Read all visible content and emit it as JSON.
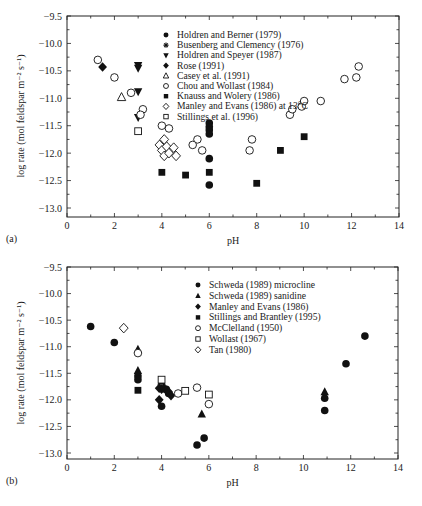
{
  "chart_data": [
    {
      "type": "scatter",
      "panel_label": "(a)",
      "xlabel": "pH",
      "ylabel": "log rate (mol feldspar m⁻² s⁻¹)",
      "xlim": [
        0,
        14
      ],
      "ylim": [
        -13.0,
        -9.5
      ],
      "xticks": [
        0,
        2,
        4,
        6,
        8,
        10,
        12,
        14
      ],
      "yticks": [
        -9.5,
        -10.0,
        -10.5,
        -11.0,
        -11.5,
        -12.0,
        -12.5,
        -13.0
      ],
      "xtick_labels": [
        "0",
        "2",
        "4",
        "6",
        "8",
        "10",
        "12",
        "14"
      ],
      "ytick_labels": [
        "-9.5",
        "-10.0",
        "-10.5",
        "-11.0",
        "-11.5",
        "-12.0",
        "-12.5",
        "-13.0"
      ],
      "grid": false,
      "legend_position": "upper center",
      "series": [
        {
          "name": "Holdren and Berner (1979)",
          "marker": "filled-circle",
          "points": [
            [
              6.0,
              -11.45
            ],
            [
              6.0,
              -11.52
            ],
            [
              6.0,
              -11.58
            ],
            [
              6.0,
              -11.65
            ],
            [
              6.0,
              -12.1
            ],
            [
              6.0,
              -12.58
            ]
          ]
        },
        {
          "name": "Busenberg and Clemency (1976)",
          "marker": "asterisk",
          "points": []
        },
        {
          "name": "Holdren and Speyer (1987)",
          "marker": "filled-triangle-down",
          "points": [
            [
              3.0,
              -10.4
            ],
            [
              3.0,
              -10.45
            ],
            [
              3.0,
              -10.88
            ],
            [
              3.0,
              -11.35
            ]
          ]
        },
        {
          "name": "Rose (1991)",
          "marker": "filled-diamond",
          "points": [
            [
              1.5,
              -10.43
            ]
          ]
        },
        {
          "name": "Casey et al. (1991)",
          "marker": "open-triangle-up",
          "points": [
            [
              2.3,
              -10.98
            ]
          ]
        },
        {
          "name": "Chou and Wollast (1984)",
          "marker": "open-circle",
          "points": [
            [
              1.3,
              -10.3
            ],
            [
              2.0,
              -10.62
            ],
            [
              2.7,
              -10.9
            ],
            [
              3.2,
              -11.2
            ],
            [
              3.1,
              -11.3
            ],
            [
              4.0,
              -11.5
            ],
            [
              4.3,
              -11.55
            ],
            [
              5.5,
              -11.75
            ],
            [
              5.3,
              -11.85
            ],
            [
              5.7,
              -11.95
            ],
            [
              7.8,
              -11.75
            ],
            [
              7.7,
              -11.95
            ],
            [
              9.4,
              -11.3
            ],
            [
              9.5,
              -11.2
            ],
            [
              9.9,
              -11.15
            ],
            [
              10.0,
              -11.05
            ],
            [
              10.7,
              -11.05
            ],
            [
              11.7,
              -10.65
            ],
            [
              12.2,
              -10.62
            ],
            [
              12.3,
              -10.42
            ]
          ]
        },
        {
          "name": "Knauss and Wolery (1986)",
          "marker": "filled-square",
          "points": [
            [
              4.0,
              -12.35
            ],
            [
              5.0,
              -12.4
            ],
            [
              6.0,
              -12.35
            ],
            [
              8.0,
              -12.55
            ],
            [
              9.0,
              -11.95
            ],
            [
              10.0,
              -11.7
            ]
          ]
        },
        {
          "name": "Manley and Evans (1986) at 13°C",
          "marker": "open-diamond",
          "points": [
            [
              3.9,
              -11.85
            ],
            [
              4.0,
              -11.95
            ],
            [
              4.1,
              -12.05
            ],
            [
              4.2,
              -11.88
            ],
            [
              4.3,
              -12.0
            ],
            [
              4.5,
              -11.9
            ],
            [
              4.6,
              -12.05
            ],
            [
              4.1,
              -11.75
            ]
          ]
        },
        {
          "name": "Stillings et al. (1996)",
          "marker": "open-square",
          "points": [
            [
              3.0,
              -11.6
            ]
          ]
        }
      ]
    },
    {
      "type": "scatter",
      "panel_label": "(b)",
      "xlabel": "pH",
      "ylabel": "log rate (mol feldspar m⁻² s⁻¹)",
      "xlim": [
        0,
        14
      ],
      "ylim": [
        -13.0,
        -9.5
      ],
      "xticks": [
        0,
        2,
        4,
        6,
        8,
        10,
        12,
        14
      ],
      "yticks": [
        -9.5,
        -10.0,
        -10.5,
        -11.0,
        -11.5,
        -12.0,
        -12.5,
        -13.0
      ],
      "xtick_labels": [
        "0",
        "2",
        "4",
        "6",
        "8",
        "10",
        "12",
        "14"
      ],
      "ytick_labels": [
        "-9.5",
        "-10.0",
        "-10.5",
        "-11.0",
        "-11.5",
        "-12.0",
        "-12.5",
        "-13.0"
      ],
      "grid": false,
      "legend_position": "upper center",
      "series": [
        {
          "name": "Schweda (1989) microcline",
          "marker": "filled-circle",
          "points": [
            [
              1.0,
              -10.62
            ],
            [
              2.0,
              -10.92
            ],
            [
              3.0,
              -11.55
            ],
            [
              3.0,
              -11.62
            ],
            [
              4.0,
              -12.12
            ],
            [
              4.2,
              -11.8
            ],
            [
              4.3,
              -11.88
            ],
            [
              5.5,
              -12.85
            ],
            [
              5.8,
              -12.72
            ],
            [
              10.9,
              -11.97
            ],
            [
              10.9,
              -12.2
            ],
            [
              11.8,
              -11.32
            ],
            [
              12.6,
              -10.8
            ]
          ]
        },
        {
          "name": "Schweda (1989) sanidine",
          "marker": "filled-triangle-up",
          "points": [
            [
              3.0,
              -11.05
            ],
            [
              3.0,
              -11.45
            ],
            [
              4.0,
              -11.65
            ],
            [
              5.7,
              -12.27
            ],
            [
              10.9,
              -11.85
            ]
          ]
        },
        {
          "name": "Manley and Evans (1986)",
          "marker": "filled-diamond",
          "points": [
            [
              3.9,
              -11.78
            ],
            [
              4.0,
              -11.8
            ],
            [
              4.1,
              -11.78
            ],
            [
              4.2,
              -11.82
            ],
            [
              4.3,
              -11.85
            ],
            [
              4.4,
              -11.92
            ],
            [
              3.9,
              -12.0
            ]
          ]
        },
        {
          "name": "Stillings and Brantley (1995)",
          "marker": "filled-square",
          "points": [
            [
              3.0,
              -11.82
            ]
          ]
        },
        {
          "name": "McClelland (1950)",
          "marker": "open-circle",
          "points": [
            [
              3.0,
              -11.12
            ],
            [
              4.7,
              -11.88
            ],
            [
              5.5,
              -11.77
            ],
            [
              6.0,
              -12.08
            ]
          ]
        },
        {
          "name": "Wollast (1967)",
          "marker": "open-square",
          "points": [
            [
              4.0,
              -11.62
            ],
            [
              5.0,
              -11.83
            ],
            [
              6.0,
              -11.9
            ]
          ]
        },
        {
          "name": "Tan (1980)",
          "marker": "open-diamond",
          "points": [
            [
              2.4,
              -10.65
            ]
          ]
        }
      ]
    }
  ]
}
